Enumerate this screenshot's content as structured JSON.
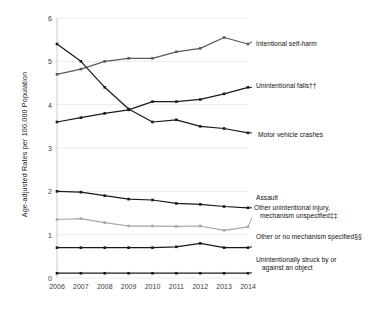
{
  "chart_data": {
    "type": "line",
    "title": "",
    "xlabel": "",
    "ylabel": "Age-adjusted Rates per 100,000 Population",
    "categories": [
      "2006",
      "2007",
      "2008",
      "2009",
      "2010",
      "2011",
      "2012",
      "2013",
      "2014"
    ],
    "x": [
      2006,
      2007,
      2008,
      2009,
      2010,
      2011,
      2012,
      2013,
      2014
    ],
    "xlim": [
      2006,
      2014
    ],
    "ylim": [
      0,
      6
    ],
    "yticks": [
      "0",
      "1",
      "2",
      "3",
      "4",
      "5",
      "6"
    ],
    "ytick_values": [
      0,
      1,
      2,
      3,
      4,
      5,
      6
    ],
    "grid": "horizontal",
    "legend_position": "right-inline",
    "series": [
      {
        "name": "Intentional self-harm",
        "color": "#595959",
        "label_x": 2014,
        "label_y": 5.45,
        "values": [
          4.7,
          4.82,
          5.0,
          5.07,
          5.07,
          5.22,
          5.3,
          5.55,
          5.4
        ]
      },
      {
        "name": "Unintentional falls††",
        "color": "#1a1a1a",
        "label_x": 2014,
        "label_y": 4.4,
        "values": [
          3.6,
          3.7,
          3.8,
          3.88,
          4.07,
          4.07,
          4.12,
          4.25,
          4.4
        ]
      },
      {
        "name": "Motor vehicle crashes",
        "color": "#1a1a1a",
        "label_x": 2014,
        "label_y": 3.35,
        "values": [
          5.4,
          5.0,
          4.4,
          3.9,
          3.6,
          3.65,
          3.5,
          3.45,
          3.35
        ]
      },
      {
        "name": "Assault",
        "color": "#1a1a1a",
        "label_x": 2014,
        "label_y": 1.62,
        "values": [
          2.0,
          1.98,
          1.9,
          1.82,
          1.8,
          1.72,
          1.7,
          1.65,
          1.62
        ]
      },
      {
        "name": "Other unintentional injury, mechanism unspecified‡‡",
        "color": "#a6a6a6",
        "label_x": 2014,
        "label_y": 1.4,
        "values": [
          1.35,
          1.37,
          1.28,
          1.2,
          1.2,
          1.19,
          1.2,
          1.1,
          1.18
        ]
      },
      {
        "name": "Other or no mechanism specified§§",
        "color": "#1a1a1a",
        "label_x": 2014,
        "label_y": 0.72,
        "values": [
          0.7,
          0.7,
          0.7,
          0.7,
          0.7,
          0.72,
          0.8,
          0.7,
          0.7
        ]
      },
      {
        "name": "Unintentionally struck by or against an object",
        "color": "#1a1a1a",
        "label_x": 2014,
        "label_y": 0.12,
        "values": [
          0.11,
          0.11,
          0.11,
          0.11,
          0.11,
          0.11,
          0.11,
          0.11,
          0.11
        ]
      }
    ],
    "legend_entries": [
      {
        "label": "Intentional self-harm",
        "color": "#595959"
      },
      {
        "label": "Unintentional falls††",
        "color": "#1a1a1a"
      },
      {
        "label": "Motor vehicle crashes",
        "color": "#1a1a1a"
      },
      {
        "label": "Assault",
        "color": "#1a1a1a"
      },
      {
        "label": "Other unintentional injury,",
        "color": "#a6a6a6"
      },
      {
        "label": "mechanism unspecified‡‡",
        "color": "#a6a6a6"
      },
      {
        "label": "Other or no mechanism specified§§",
        "color": "#1a1a1a"
      },
      {
        "label": "Unintentionally struck by or",
        "color": "#1a1a1a"
      },
      {
        "label": "against an object",
        "color": "#1a1a1a"
      }
    ]
  }
}
